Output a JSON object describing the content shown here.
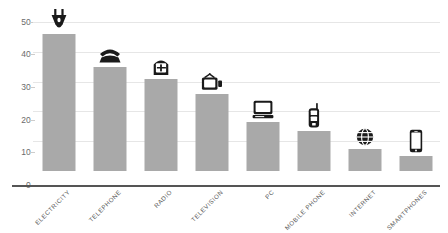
{
  "chart_data": {
    "type": "bar",
    "title": "",
    "subtitle": "",
    "xlabel": "",
    "ylabel": "",
    "categories": [
      "ELECTRICITY",
      "TELEPHONE",
      "RADIO",
      "TELEVISION",
      "PC",
      "MOBILE PHONE",
      "INTERNET",
      "SMARTPHONES"
    ],
    "values": [
      46,
      35,
      31,
      26,
      16.5,
      13.5,
      7.5,
      5
    ],
    "ylim": [
      0,
      50
    ],
    "yticks": [
      0,
      10,
      20,
      30,
      40,
      50
    ],
    "ytick_labels": [
      "0",
      "10",
      "20",
      "30",
      "40",
      "50"
    ],
    "grid": true,
    "legend": "none",
    "series": [
      {
        "name": "",
        "values": [
          46,
          35,
          31,
          26,
          16.5,
          13.5,
          7.5,
          5
        ]
      }
    ],
    "icons": [
      "power-plug-icon",
      "rotary-telephone-icon",
      "radio-icon",
      "television-icon",
      "desktop-computer-icon",
      "mobile-phone-icon",
      "globe-internet-icon",
      "smartphone-icon"
    ]
  },
  "colors": {
    "bar_fill": "#a9a9a9",
    "gridline": "#e6e6e6",
    "baseline": "#555555",
    "tick_text": "#6b6b6b",
    "category_text": "#5a5a5a",
    "icon": "#1a1a1a",
    "background": "#ffffff"
  }
}
